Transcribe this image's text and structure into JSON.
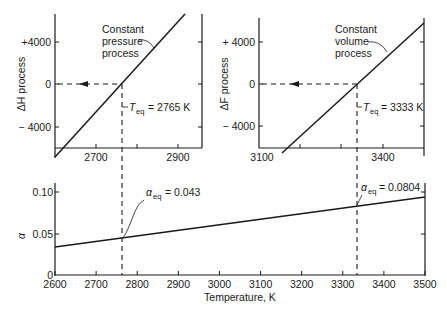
{
  "figure": {
    "title": "",
    "colors": {
      "line": "#1a1a1a",
      "background": "#ffffff"
    }
  },
  "chart_data": [
    {
      "id": "top-left",
      "type": "line",
      "title": "",
      "xlabel": "",
      "ylabel": "ΔH process",
      "ylabel_italic_part": "H",
      "xlim": [
        2600,
        2960
      ],
      "ylim": [
        -6200,
        6200
      ],
      "xticks": [
        2700,
        2800,
        2900
      ],
      "xtick_labels": [
        "2700",
        "",
        "2900"
      ],
      "yticks": [
        4000,
        0,
        -4000
      ],
      "ytick_labels": [
        "+4000",
        "0",
        "− 4000"
      ],
      "grid": false,
      "series": [
        {
          "name": "Constant pressure process",
          "x": [
            2600,
            2913
          ],
          "y": [
            -7000,
            6500
          ]
        }
      ],
      "annotations": [
        {
          "text": "Constant",
          "line2": "pressure",
          "line3": "process"
        },
        {
          "text": "T",
          "sub": "eq",
          "value": "= 2765 K"
        }
      ],
      "equilibrium": {
        "x": 2765,
        "y": 0
      }
    },
    {
      "id": "top-right",
      "type": "line",
      "title": "",
      "xlabel": "",
      "ylabel": "ΔF process",
      "xlim": [
        3100,
        3500
      ],
      "ylim": [
        -6200,
        6200
      ],
      "xticks": [
        3200,
        3300,
        3400
      ],
      "xtick_labels": [
        "",
        "",
        "3400"
      ],
      "xlim_label": "3100",
      "yticks": [
        4000,
        0,
        -4000
      ],
      "ytick_labels": [
        "+ 4000",
        "0",
        "− 4000"
      ],
      "grid": false,
      "series": [
        {
          "name": "Constant volume process",
          "x": [
            3160,
            3500
          ],
          "y": [
            -7000,
            5900
          ]
        }
      ],
      "annotations": [
        {
          "text": "Constant",
          "line2": "volume",
          "line3": "process"
        },
        {
          "text": "T",
          "sub": "eq",
          "value": "= 3333 K"
        }
      ],
      "equilibrium": {
        "x": 3333,
        "y": 0
      }
    },
    {
      "id": "bottom",
      "type": "line",
      "title": "",
      "xlabel": "Temperature, K",
      "ylabel": "α",
      "xlim": [
        2600,
        3500
      ],
      "ylim": [
        0,
        0.11
      ],
      "xticks": [
        2600,
        2700,
        2800,
        2900,
        3000,
        3100,
        3200,
        3300,
        3400,
        3500
      ],
      "xtick_labels": [
        "2600",
        "2700",
        "2800",
        "2900",
        "3000",
        "3100",
        "3200",
        "3300",
        "3400",
        "3500"
      ],
      "yticks": [
        0,
        0.05,
        0.1
      ],
      "ytick_labels": [
        "0",
        "0.05",
        "0.10"
      ],
      "grid": false,
      "series": [
        {
          "name": "α",
          "x": [
            2600,
            3500
          ],
          "y": [
            0.034,
            0.094
          ]
        }
      ],
      "annotations": [
        {
          "text": "α",
          "sub": "eq",
          "value": "= 0.043",
          "x": 2765,
          "y": 0.043
        },
        {
          "text": "α",
          "sub": "eq",
          "value": "= 0.0804",
          "x": 3333,
          "y": 0.0804
        }
      ]
    }
  ]
}
